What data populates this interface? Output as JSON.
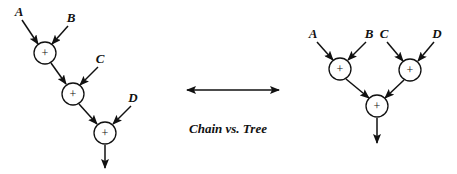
{
  "caption": "Chain vs. Tree",
  "operator_symbol": "+",
  "chain": {
    "inputs": [
      {
        "label": "A",
        "x": 19,
        "y": 16
      },
      {
        "label": "B",
        "x": 71,
        "y": 22
      },
      {
        "label": "C",
        "x": 100,
        "y": 63
      },
      {
        "label": "D",
        "x": 133,
        "y": 102
      }
    ],
    "nodes": [
      {
        "x": 45,
        "y": 53
      },
      {
        "x": 73,
        "y": 94
      },
      {
        "x": 105,
        "y": 133
      }
    ]
  },
  "tree": {
    "inputs": [
      {
        "label": "A",
        "x": 313,
        "y": 38
      },
      {
        "label": "B",
        "x": 369,
        "y": 38
      },
      {
        "label": "C",
        "x": 384,
        "y": 38
      },
      {
        "label": "D",
        "x": 437,
        "y": 38
      }
    ],
    "nodes": [
      {
        "x": 340,
        "y": 69
      },
      {
        "x": 410,
        "y": 70
      },
      {
        "x": 377,
        "y": 106
      }
    ]
  },
  "colors": {
    "stroke": "#111111",
    "background": "#ffffff"
  }
}
